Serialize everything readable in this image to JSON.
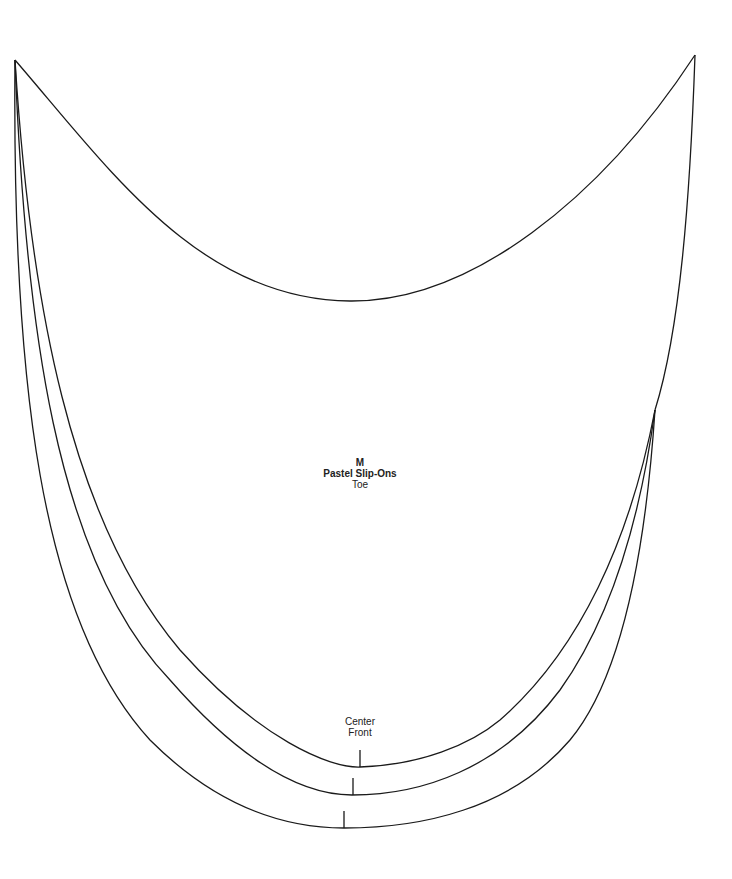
{
  "pattern": {
    "size": "M",
    "name": "Pastel Slip-Ons",
    "piece": "Toe",
    "center_label_line1": "Center",
    "center_label_line2": "Front"
  },
  "colors": {
    "stroke": "#1a1a1a",
    "background": "#ffffff"
  }
}
